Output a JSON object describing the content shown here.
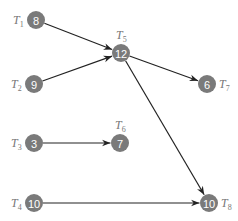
{
  "diagram": {
    "type": "task-graph",
    "nodes": [
      {
        "id": "T1",
        "label": "T",
        "sub": "1",
        "value": "8",
        "x": 36,
        "y": 20,
        "label_pos": "left"
      },
      {
        "id": "T2",
        "label": "T",
        "sub": "2",
        "value": "9",
        "x": 34,
        "y": 84,
        "label_pos": "left"
      },
      {
        "id": "T3",
        "label": "T",
        "sub": "3",
        "value": "3",
        "x": 34,
        "y": 143,
        "label_pos": "left"
      },
      {
        "id": "T4",
        "label": "T",
        "sub": "4",
        "value": "10",
        "x": 34,
        "y": 203,
        "label_pos": "left"
      },
      {
        "id": "T5",
        "label": "T",
        "sub": "5",
        "value": "12",
        "x": 121,
        "y": 53,
        "label_pos": "top"
      },
      {
        "id": "T6",
        "label": "T",
        "sub": "6",
        "value": "7",
        "x": 120,
        "y": 143,
        "label_pos": "top"
      },
      {
        "id": "T7",
        "label": "T",
        "sub": "7",
        "value": "6",
        "x": 207,
        "y": 84,
        "label_pos": "right"
      },
      {
        "id": "T8",
        "label": "T",
        "sub": "8",
        "value": "10",
        "x": 209,
        "y": 203,
        "label_pos": "right"
      }
    ],
    "edges": [
      {
        "from": "T1",
        "to": "T5"
      },
      {
        "from": "T2",
        "to": "T5"
      },
      {
        "from": "T5",
        "to": "T7"
      },
      {
        "from": "T5",
        "to": "T8"
      },
      {
        "from": "T3",
        "to": "T6"
      },
      {
        "from": "T4",
        "to": "T8"
      }
    ],
    "colors": {
      "node_fill": "#7a7a7a",
      "node_text": "#ffffff",
      "label": "#777777",
      "edge": "#222222"
    }
  }
}
